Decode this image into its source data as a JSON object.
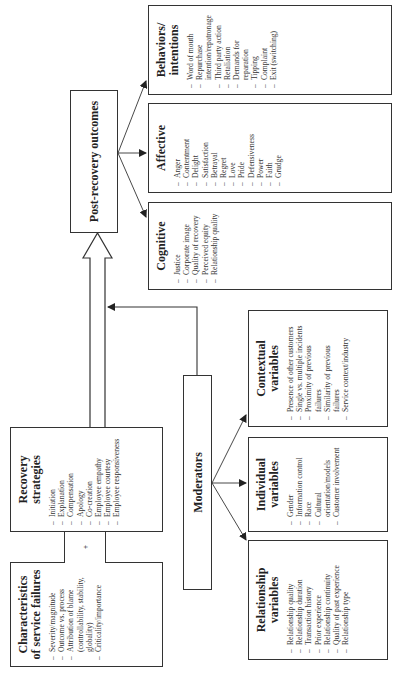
{
  "diagram": {
    "orientation": "rotated -90 degrees (reads bottom to top)",
    "characteristics": {
      "title": "Characteristics of service failures",
      "title_line1": "Characteristics",
      "title_line2": "of service failures",
      "items": [
        {
          "text": "Severity/magnitude",
          "dash": true
        },
        {
          "text": "Outcome vs. process",
          "dash": true
        },
        {
          "text": "Attribution of blame",
          "dash": true
        },
        {
          "text": "(controllability, stability,",
          "dash": false
        },
        {
          "text": "globality)",
          "dash": false
        },
        {
          "text": "Criticality/importance",
          "dash": true
        }
      ]
    },
    "connector_symbol": "+",
    "recovery": {
      "title_line1": "Recovery",
      "title_line2": "strategies",
      "items": [
        {
          "text": "Initiation",
          "dash": true
        },
        {
          "text": "Explanation",
          "dash": true
        },
        {
          "text": "Compensation",
          "dash": true
        },
        {
          "text": "Apology",
          "dash": true
        },
        {
          "text": "Co-creation",
          "dash": true
        },
        {
          "text": "Employee empathy",
          "dash": true
        },
        {
          "text": "Employee courtesy",
          "dash": true
        },
        {
          "text": "Employee responsiveness",
          "dash": true
        }
      ]
    },
    "outcomes": {
      "title": "Post-recovery outcomes"
    },
    "moderators": {
      "title": "Moderators"
    },
    "relationship": {
      "title_line1": "Relationship",
      "title_line2": "variables",
      "items": [
        {
          "text": "Relationship quality",
          "dash": true
        },
        {
          "text": "Relationship duration",
          "dash": true
        },
        {
          "text": "Transaction history",
          "dash": true
        },
        {
          "text": "Prior experience",
          "dash": true
        },
        {
          "text": "Relationship continuity",
          "dash": true
        },
        {
          "text": "Quality of past experience",
          "dash": true
        },
        {
          "text": "Relationship type",
          "dash": true
        }
      ]
    },
    "individual": {
      "title_line1": "Individual",
      "title_line2": "variables",
      "items": [
        {
          "text": "Gender",
          "dash": true
        },
        {
          "text": "Information control",
          "dash": true
        },
        {
          "text": "Race",
          "dash": true
        },
        {
          "text": "Cultural",
          "dash": true
        },
        {
          "text": "orientation/models",
          "dash": false
        },
        {
          "text": "Customer involvement",
          "dash": true
        }
      ]
    },
    "contextual": {
      "title_line1": "Contextual",
      "title_line2": "variables",
      "items": [
        {
          "text": "Presence of other customers",
          "dash": true
        },
        {
          "text": "Single vs. multiple incidents",
          "dash": true
        },
        {
          "text": "Proximity of previous",
          "dash": true
        },
        {
          "text": "failures",
          "dash": false
        },
        {
          "text": "Similarity of previous",
          "dash": true
        },
        {
          "text": "failures",
          "dash": false
        },
        {
          "text": "Service context/industry",
          "dash": true
        }
      ]
    },
    "cognitive": {
      "title": "Cognitive",
      "items": [
        {
          "text": "Justice",
          "dash": true
        },
        {
          "text": "Corporate image",
          "dash": true
        },
        {
          "text": "Quality of recovery",
          "dash": true
        },
        {
          "text": "Perceived equity",
          "dash": true
        },
        {
          "text": "Relationship quality",
          "dash": true
        }
      ]
    },
    "affective": {
      "title": "Affective",
      "items": [
        {
          "text": "Anger",
          "dash": true
        },
        {
          "text": "Contentment",
          "dash": true
        },
        {
          "text": "Delight",
          "dash": true
        },
        {
          "text": "Satisfaction",
          "dash": true
        },
        {
          "text": "Betrayal",
          "dash": true
        },
        {
          "text": "Regret",
          "dash": true
        },
        {
          "text": "Love",
          "dash": true
        },
        {
          "text": "Pride",
          "dash": true
        },
        {
          "text": "Defensiveness",
          "dash": true
        },
        {
          "text": "Power",
          "dash": true
        },
        {
          "text": "Faith",
          "dash": true
        },
        {
          "text": "Grudge",
          "dash": true
        }
      ]
    },
    "behaviors": {
      "title_line1": "Behaviors/",
      "title_line2": "intentions",
      "items": [
        {
          "text": "Word of mouth",
          "dash": true
        },
        {
          "text": "Repurchase",
          "dash": true
        },
        {
          "text": "intention/repatronage",
          "dash": false
        },
        {
          "text": "Third party action",
          "dash": true
        },
        {
          "text": "Retaliation",
          "dash": true
        },
        {
          "text": "Demands for",
          "dash": true
        },
        {
          "text": "reparation",
          "dash": false
        },
        {
          "text": "Tipping",
          "dash": true
        },
        {
          "text": "Complaint",
          "dash": true
        },
        {
          "text": "Exit (switching)",
          "dash": true
        }
      ]
    },
    "colors": {
      "line": "#333333",
      "text": "#222222",
      "background": "#ffffff"
    }
  }
}
